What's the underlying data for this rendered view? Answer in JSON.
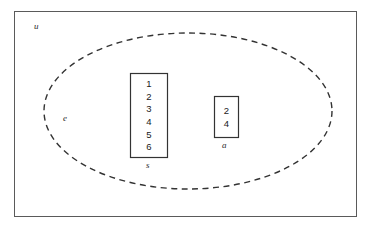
{
  "diagram": {
    "type": "venn-set-diagram",
    "universe": {
      "label": "u",
      "shape": "rectangle",
      "border_color": "#555555"
    },
    "ellipse": {
      "label": "e",
      "shape": "dashed-ellipse",
      "border_color": "#333333",
      "dash": "dashed"
    },
    "sets": [
      {
        "name": "set-s",
        "label": "s",
        "members": [
          "1",
          "2",
          "3",
          "4",
          "5",
          "6"
        ],
        "border_color": "#333333"
      },
      {
        "name": "set-a",
        "label": "a",
        "members": [
          "2",
          "4"
        ],
        "border_color": "#333333"
      }
    ]
  }
}
